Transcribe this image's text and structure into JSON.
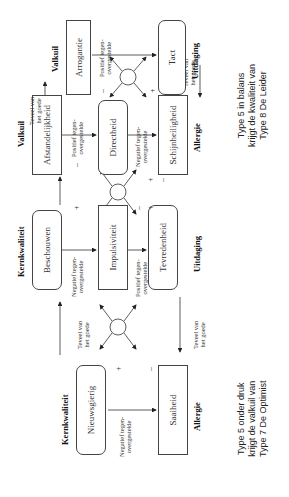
{
  "diagram": {
    "row_labels": {
      "kernkwaliteit": "Kernkwaliteit",
      "valkuil": "Valkuil",
      "uitdaging": "Uitdaging",
      "allergie": "Allergie"
    },
    "blocks": [
      {
        "top_label": "Kernkwaliteit",
        "top_box": "Nieuwsgierig",
        "bottom_box": "Saaiheid",
        "bottom_label": "Allergie",
        "edge_text": "Negatief tegen-\novergestelde"
      },
      {
        "top_label": "Kernkwaliteit",
        "top_box": "Beschouwen",
        "middle_box": "Impulsiviteit",
        "bottom_box": "Tevredenheid",
        "bottom_label": "Uitdaging",
        "edge_text_top": "Negatief tegen-\novergestelde",
        "edge_text_bottom": "Positief tegen-\novergestelde"
      },
      {
        "top_label": "Valkuil",
        "top_box": "Afstandelijkheid",
        "middle_box": "Directheid",
        "bottom_box": "Schijnheiligheid",
        "bottom_label": "Allergie",
        "edge_text_top": "Positief tegen-\novergestelde",
        "edge_text_bottom": "Negatief tegen-\novergestelde"
      },
      {
        "top_label": "Valkuil",
        "top_box": "Arrogantie",
        "bottom_box": "Tact",
        "bottom_label": "Uitdaging",
        "edge_text": "Positief tegen-\novergestelde"
      }
    ],
    "connector_text": "Teveel van\nhet goede",
    "signs": {
      "plus": "+",
      "minus": "–"
    },
    "captions": {
      "left": "Type 5 onder druk\nkrijgt de valkuil van\nType 7 De Optimist",
      "right": "Type 5 in balans\nkrijgt de kwaliteit van\nType 8 De Leider"
    }
  }
}
